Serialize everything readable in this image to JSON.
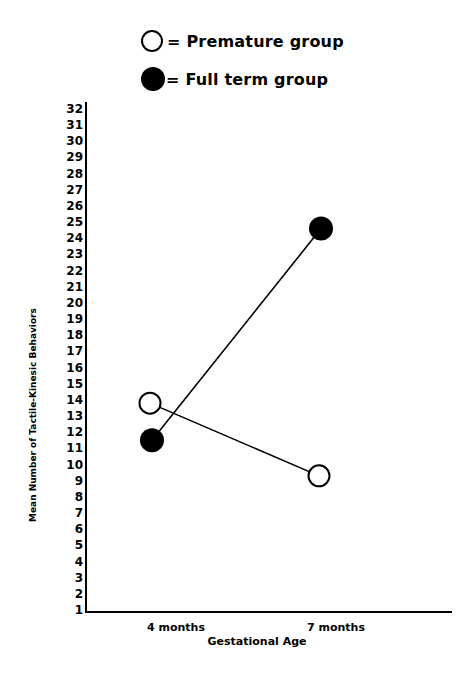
{
  "chart_data": {
    "type": "line",
    "title": "",
    "xlabel": "Gestational Age",
    "ylabel": "Mean Number of Tactile-Kinesic Behaviors",
    "categories": [
      "4 months",
      "7 months"
    ],
    "series": [
      {
        "name": "Premature group",
        "marker": "open-circle",
        "values": [
          13.8,
          9.3
        ]
      },
      {
        "name": "Full term group",
        "marker": "filled-circle",
        "values": [
          11.5,
          24.6
        ]
      }
    ],
    "ylim": [
      1,
      32
    ],
    "yticks": [
      1,
      2,
      3,
      4,
      5,
      6,
      7,
      8,
      9,
      10,
      11,
      12,
      13,
      14,
      15,
      16,
      17,
      18,
      19,
      20,
      21,
      22,
      23,
      24,
      25,
      26,
      27,
      28,
      29,
      30,
      31,
      32
    ],
    "grid": false,
    "legend_position": "top-left, above plot"
  },
  "legend": {
    "premature": "= Premature group",
    "fullterm": "= Full term group"
  },
  "colors": {
    "line": "#000000",
    "background": "#ffffff"
  }
}
